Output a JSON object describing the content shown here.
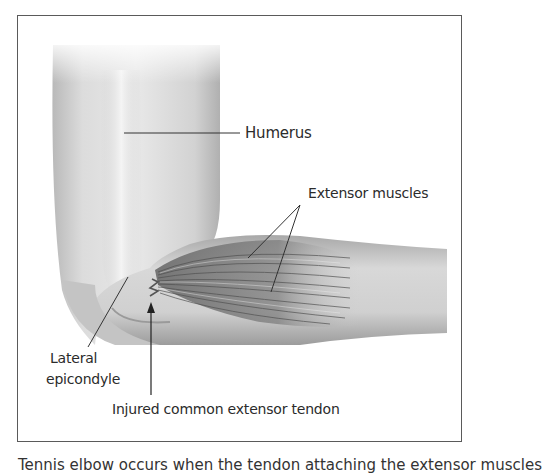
{
  "figure": {
    "labels": {
      "humerus": "Humerus",
      "extensor_muscles": "Extensor muscles",
      "lateral_epicondyle_line1": "Lateral",
      "lateral_epicondyle_line2": "epicondyle",
      "injured_tendon": "Injured common extensor tendon"
    },
    "caption": "Tennis elbow occurs when the tendon attaching the extensor muscles"
  },
  "colors": {
    "frame": "#5a5a5a",
    "text": "#2b2b2b",
    "leader_line": "#333333",
    "skin_light": "#f2f2f2",
    "skin_mid": "#bdbdbd",
    "muscle_dark": "#6e6e6e"
  }
}
